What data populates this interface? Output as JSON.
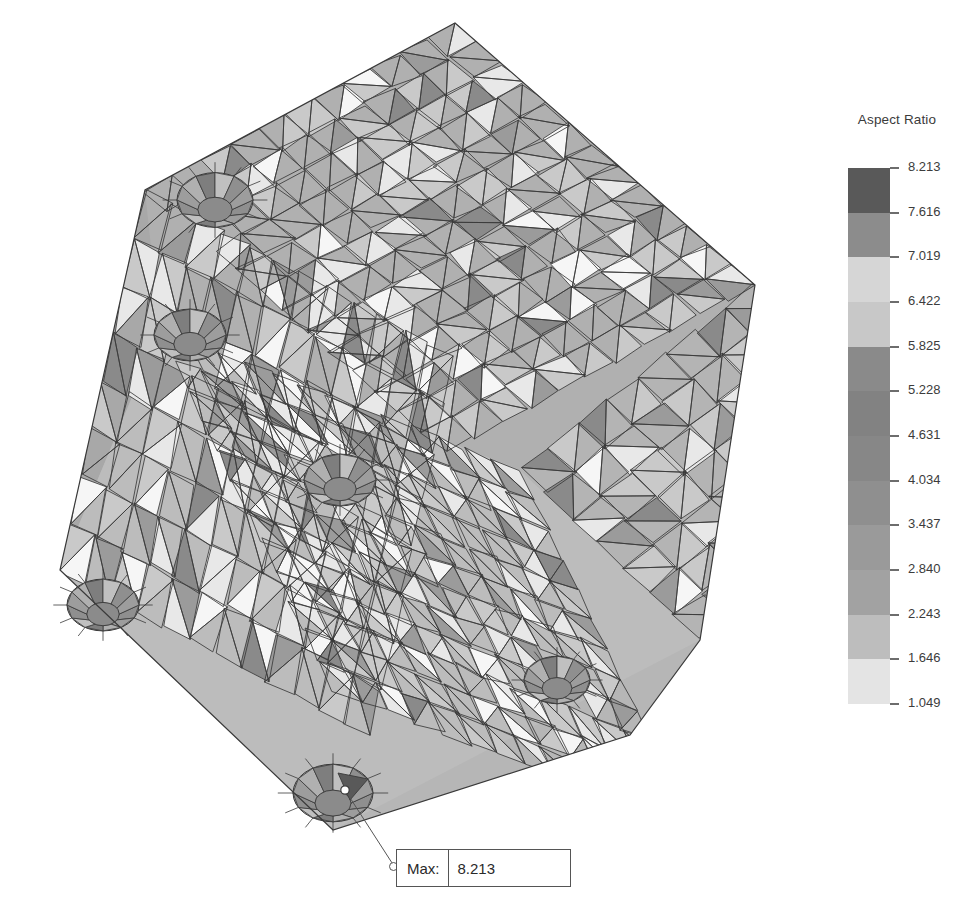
{
  "plot": {
    "title": "Aspect Ratio",
    "background_color": "#ffffff",
    "mesh_edge_color": "#3a3a3a",
    "model_description": "Triangular surface finite-element mesh of a rotated rectangular block containing five cylindrical through-holes, shaded by element aspect ratio"
  },
  "legend": {
    "title": "Aspect Ratio",
    "orientation": "vertical",
    "title_color": "#3b3b3b",
    "label_color": "#3c3c3c",
    "tick_color": "#6d6d6d",
    "min": 1.049,
    "max": 8.213,
    "step": 0.597,
    "band_count": 12,
    "ticks": [
      "8.213",
      "7.616",
      "7.019",
      "6.422",
      "5.825",
      "5.228",
      "4.631",
      "4.034",
      "3.437",
      "2.840",
      "2.243",
      "1.646",
      "1.049"
    ],
    "tick_values": [
      8.213,
      7.616,
      7.019,
      6.422,
      5.825,
      5.228,
      4.631,
      4.034,
      3.437,
      2.84,
      2.243,
      1.646,
      1.049
    ],
    "band_colors": [
      "#595959",
      "#8c8c8c",
      "#d6d6d6",
      "#c8c8c8",
      "#8a8a8a",
      "#828282",
      "#878787",
      "#8f8f8f",
      "#9a9a9a",
      "#a2a2a2",
      "#bdbdbd",
      "#e4e4e4"
    ]
  },
  "callout": {
    "label": "Max:",
    "value": "8.213",
    "border_color": "#555555",
    "anchor_icon": "circle-anchor-icon"
  },
  "chart_data": {
    "type": "heatmap",
    "title": "Aspect Ratio",
    "xlabel": "",
    "ylabel": "",
    "legend_position": "right",
    "grid": false,
    "colorbar_label": "Aspect Ratio",
    "colorbar_ticks": [
      8.213,
      7.616,
      7.019,
      6.422,
      5.825,
      5.228,
      4.631,
      4.034,
      3.437,
      2.84,
      2.243,
      1.646,
      1.049
    ],
    "value_range": [
      1.049,
      8.213
    ],
    "band_step": 0.597,
    "annotations": [
      {
        "name": "max-marker",
        "text": "Max: 8.213",
        "value": 8.213,
        "x": 345,
        "y": 790
      }
    ],
    "features": [
      {
        "name": "hole-top-left",
        "cx": 215,
        "cy": 200,
        "r": 38,
        "partial": true
      },
      {
        "name": "hole-upper-left-edge",
        "cx": 190,
        "cy": 335,
        "r": 36,
        "partial": true
      },
      {
        "name": "hole-center",
        "cx": 340,
        "cy": 480,
        "r": 36,
        "partial": false
      },
      {
        "name": "hole-left-corner",
        "cx": 103,
        "cy": 605,
        "r": 36,
        "partial": false
      },
      {
        "name": "hole-right-lower",
        "cx": 557,
        "cy": 680,
        "r": 33,
        "partial": false
      },
      {
        "name": "hole-bottom",
        "cx": 333,
        "cy": 793,
        "r": 40,
        "partial": false
      }
    ]
  }
}
